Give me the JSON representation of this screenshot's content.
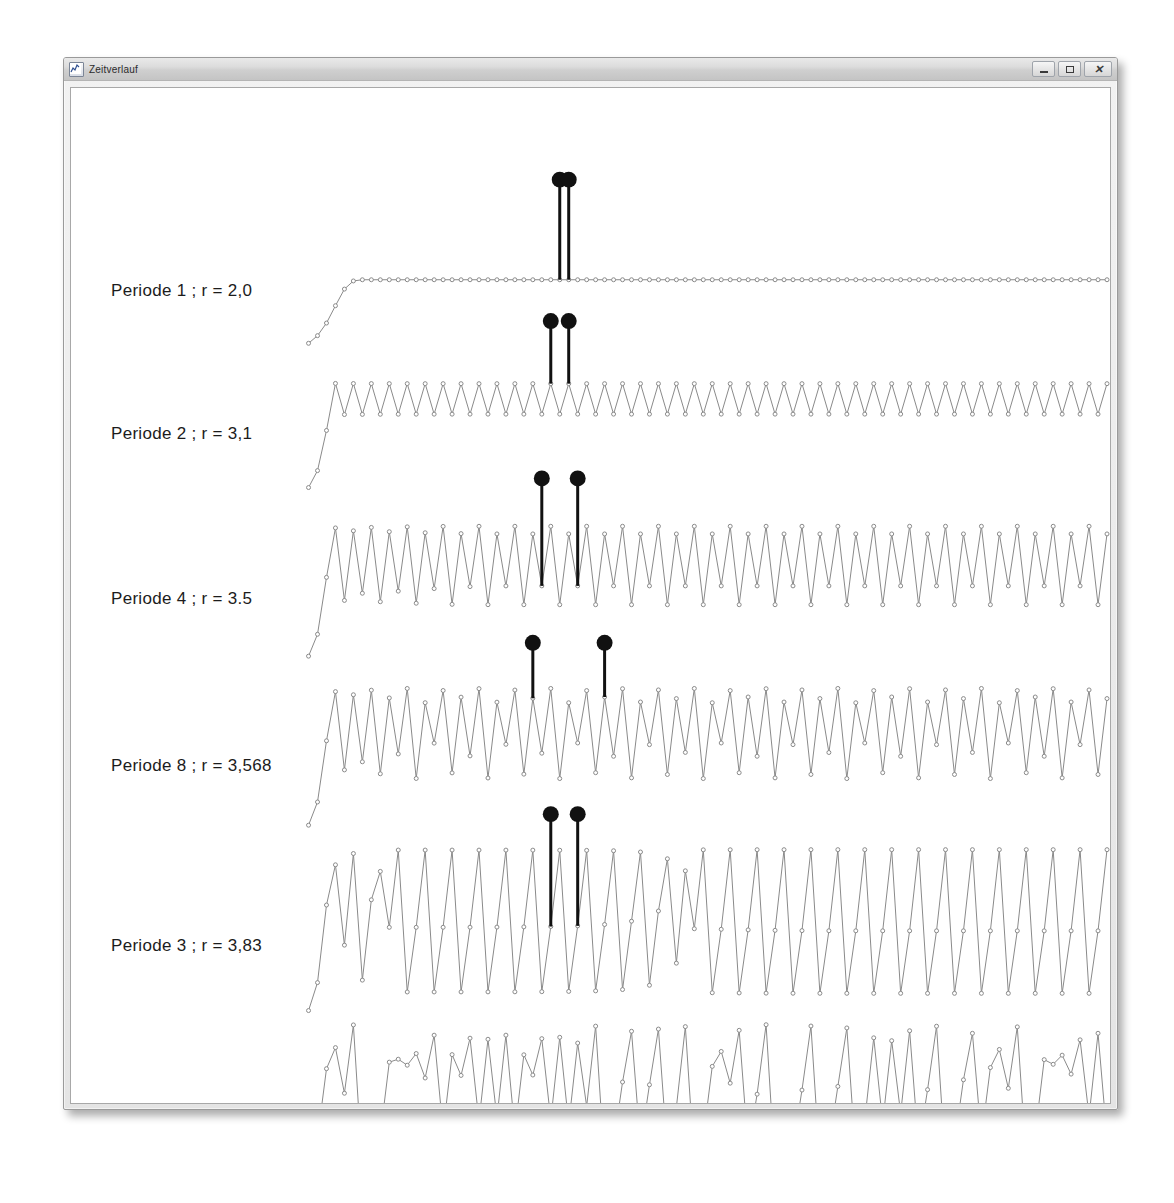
{
  "window": {
    "title": "Zeitverlauf",
    "icon": "chart-icon",
    "controls": {
      "minimize": "–",
      "maximize": "□",
      "close": "✕"
    }
  },
  "style": {
    "line_color": "#8a8a8a",
    "marker_color": "#8a8a8a",
    "pin_color": "#111111",
    "canvas_bg": "#ffffff",
    "text_color": "#1c1c1c"
  },
  "chart_data": {
    "type": "line",
    "title": "Zeitverlauf",
    "xlabel": "",
    "ylabel": "",
    "grid": false,
    "legend": "inline-left-labels",
    "n_points": 90,
    "x": [
      0,
      89
    ],
    "ylim": [
      0,
      1
    ],
    "series": [
      {
        "name": "Periode 1 ; r = 2,0",
        "label": "Periode  1 ; r = 2,0",
        "r": 2.0,
        "x0": 0.06,
        "period": 1,
        "pin_start_index": 28,
        "pin_count": 2,
        "pin_step": 1,
        "row_top": 120,
        "row_height": 145
      },
      {
        "name": "Periode 2 ; r = 3,1",
        "label": "Periode  2 ; r = 3,1",
        "r": 3.1,
        "x0": 0.06,
        "period": 2,
        "pin_start_index": 27,
        "pin_count": 2,
        "pin_step": 2,
        "row_top": 262,
        "row_height": 148
      },
      {
        "name": "Periode 4 ; r = 3.5",
        "label": "Periode  4 ; r = 3.5",
        "r": 3.5,
        "x0": 0.06,
        "period": 4,
        "pin_start_index": 26,
        "pin_count": 2,
        "pin_step": 4,
        "row_top": 420,
        "row_height": 160
      },
      {
        "name": "Periode 8 ; r = 3,568",
        "label": "Periode  8 ;  r = 3,568",
        "r": 3.568,
        "x0": 0.06,
        "period": 8,
        "pin_start_index": 25,
        "pin_count": 2,
        "pin_step": 8,
        "row_top": 585,
        "row_height": 165
      },
      {
        "name": "Periode 3 ; r = 3,83",
        "label": "Periode  3 ; r = 3,83",
        "r": 3.83,
        "x0": 0.06,
        "period": 3,
        "pin_start_index": 27,
        "pin_count": 2,
        "pin_step": 3,
        "row_top": 757,
        "row_height": 180
      },
      {
        "name": "Chaotisch ; r = 4,0",
        "label": "Chaotisch ; r = 4,0",
        "r": 4.0,
        "x0": 0.06,
        "period": 0,
        "pin_start_index": null,
        "pin_count": 0,
        "pin_step": 0,
        "row_top": 940,
        "row_height": 148
      }
    ]
  }
}
